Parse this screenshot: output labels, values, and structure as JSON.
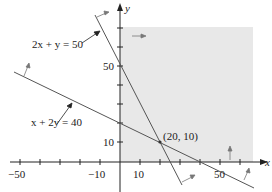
{
  "diagram": {
    "type": "linear-inequality-graph",
    "axes": {
      "x_label": "x",
      "y_label": "y"
    },
    "x_ticks": [
      {
        "value": -50,
        "label": "−50"
      },
      {
        "value": -10,
        "label": "−10"
      },
      {
        "value": 10,
        "label": "10"
      },
      {
        "value": 50,
        "label": "50"
      }
    ],
    "y_ticks": [
      {
        "value": 10,
        "label": "10"
      },
      {
        "value": 50,
        "label": "50"
      }
    ],
    "lines": [
      {
        "equation": "2x + y = 50"
      },
      {
        "equation": "x + 2y = 40"
      }
    ],
    "intersection": {
      "label": "(20, 10)"
    },
    "shaded_region": {
      "color": "#e6e6e6",
      "description": "x ≥ 0, y ≥ 0 feasible region"
    },
    "colors": {
      "line": "#555555",
      "axis": "#222222",
      "shade": "#e6e6e6"
    }
  }
}
